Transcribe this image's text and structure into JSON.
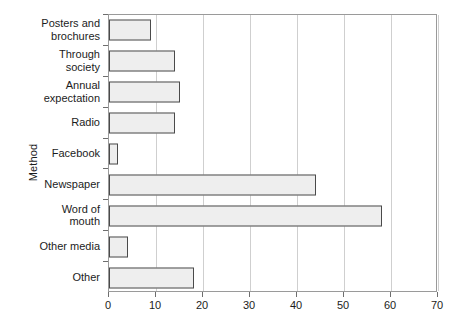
{
  "chart_data": {
    "type": "bar",
    "orientation": "horizontal",
    "title": "",
    "xlabel": "",
    "ylabel": "Method",
    "categories": [
      "Posters and\nbrochures",
      "Through\nsociety",
      "Annual\nexpectation",
      "Radio",
      "Facebook",
      "Newspaper",
      "Word of\nmouth",
      "Other media",
      "Other"
    ],
    "values": [
      9,
      14,
      15,
      14,
      2,
      44,
      58,
      4,
      18
    ],
    "xlim": [
      0,
      70
    ],
    "xticks": [
      0,
      10,
      20,
      30,
      40,
      50,
      60,
      70
    ],
    "xticklabels": [
      "0",
      "10",
      "20",
      "30",
      "40",
      "50",
      "60",
      "70"
    ],
    "grid": "vertical",
    "legend": "none",
    "bar_fill_color": "#eeeeee",
    "bar_edge_color": "#4a4a4a",
    "frame_color": "#9a9a9a",
    "gridline_color": "#cfcfcf"
  }
}
